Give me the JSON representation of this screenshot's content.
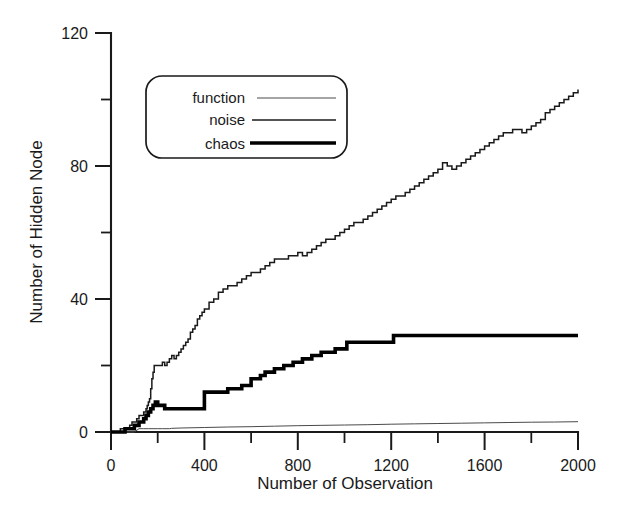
{
  "chart_data": {
    "type": "line",
    "title": "",
    "xlabel": "Number of Observation",
    "ylabel": "Number of Hidden Node",
    "xlim": [
      0,
      2000
    ],
    "ylim": [
      0,
      120
    ],
    "xticks": [
      0,
      400,
      800,
      1200,
      1600,
      2000
    ],
    "xtick_labels": [
      "0",
      "400",
      "800",
      "1200",
      "1600",
      "2000"
    ],
    "xminor_ticks": [
      200,
      600,
      1000,
      1400,
      1800
    ],
    "yticks": [
      0,
      40,
      80,
      120
    ],
    "ytick_labels": [
      "0",
      "40",
      "80",
      "120"
    ],
    "yminor_ticks": [
      20,
      60,
      100
    ],
    "grid": false,
    "legend_position": "upper-left-inset",
    "series": [
      {
        "name": "function",
        "line_weight": "thin",
        "color": "#4a4a4a",
        "x": [
          0,
          20,
          40,
          60,
          80,
          100,
          120,
          140,
          160,
          180,
          200,
          220,
          250,
          260,
          300,
          400,
          500,
          600,
          700,
          800,
          900,
          1000,
          1100,
          1200,
          1300,
          1400,
          1500,
          1600,
          1700,
          1800,
          1900,
          2000
        ],
        "values": [
          0,
          0,
          0,
          0,
          0,
          0,
          1,
          1,
          1,
          1,
          1,
          1,
          1,
          1.1,
          1.2,
          1.35,
          1.5,
          1.6,
          1.75,
          1.9,
          2.0,
          2.1,
          2.2,
          2.35,
          2.45,
          2.55,
          2.65,
          2.75,
          2.85,
          2.95,
          3.0,
          3.1
        ]
      },
      {
        "name": "noise",
        "line_weight": "medium",
        "color": "#1a1a1a",
        "x": [
          0,
          20,
          40,
          60,
          80,
          90,
          100,
          110,
          120,
          130,
          140,
          150,
          155,
          160,
          165,
          170,
          175,
          180,
          185,
          190,
          195,
          200,
          210,
          220,
          230,
          240,
          250,
          260,
          270,
          280,
          290,
          300,
          310,
          320,
          330,
          340,
          350,
          360,
          370,
          380,
          390,
          400,
          420,
          440,
          460,
          480,
          500,
          520,
          540,
          560,
          580,
          600,
          620,
          640,
          660,
          680,
          700,
          720,
          740,
          760,
          780,
          800,
          820,
          840,
          860,
          880,
          900,
          920,
          940,
          960,
          980,
          1000,
          1020,
          1040,
          1060,
          1080,
          1100,
          1120,
          1140,
          1160,
          1180,
          1200,
          1220,
          1240,
          1260,
          1280,
          1300,
          1320,
          1340,
          1360,
          1380,
          1400,
          1420,
          1440,
          1460,
          1480,
          1500,
          1520,
          1540,
          1560,
          1580,
          1600,
          1620,
          1640,
          1660,
          1680,
          1700,
          1720,
          1740,
          1760,
          1780,
          1800,
          1820,
          1840,
          1860,
          1880,
          1900,
          1920,
          1940,
          1960,
          1980,
          2000
        ],
        "values": [
          0,
          0,
          1,
          1,
          2,
          3,
          3,
          4,
          5,
          5,
          6,
          7,
          8,
          9,
          10,
          13,
          16,
          18,
          20,
          20,
          20,
          20,
          20,
          21,
          20,
          21,
          22,
          23,
          22,
          23,
          24,
          25,
          26,
          27,
          28,
          30,
          31,
          32,
          34,
          35,
          36,
          37,
          39,
          40,
          42,
          43,
          44,
          44,
          45,
          46,
          47,
          48,
          48,
          49,
          50,
          51,
          52,
          52,
          52,
          53,
          53,
          54,
          53,
          54,
          55,
          56,
          57,
          58,
          58,
          59,
          60,
          61,
          62,
          63,
          63,
          64,
          65,
          66,
          67,
          68,
          69,
          70,
          71,
          71,
          72,
          73,
          74,
          75,
          76,
          77,
          78,
          79,
          81,
          80,
          79,
          80,
          81,
          82,
          83,
          84,
          85,
          86,
          87,
          88,
          89,
          90,
          90,
          91,
          91,
          90,
          91,
          92,
          93,
          94,
          96,
          97,
          98,
          99,
          100,
          101,
          102,
          103
        ]
      },
      {
        "name": "chaos",
        "line_weight": "thick",
        "color": "#000000",
        "x": [
          0,
          40,
          60,
          80,
          100,
          120,
          140,
          150,
          160,
          170,
          180,
          190,
          200,
          210,
          230,
          250,
          260,
          390,
          400,
          420,
          440,
          490,
          500,
          540,
          560,
          590,
          600,
          620,
          640,
          660,
          680,
          700,
          720,
          740,
          760,
          780,
          800,
          820,
          840,
          860,
          880,
          900,
          940,
          960,
          1000,
          1010,
          1200,
          1210,
          2000
        ],
        "values": [
          0,
          0,
          1,
          1,
          2,
          3,
          4,
          5,
          6,
          7,
          8,
          9,
          8,
          8,
          7,
          7,
          7,
          7,
          12,
          12,
          12,
          12,
          13,
          13,
          14,
          14,
          16,
          16,
          17,
          18,
          18,
          19,
          19,
          20,
          20,
          21,
          21,
          22,
          22,
          23,
          23,
          24,
          24,
          25,
          25,
          27,
          27,
          29,
          29
        ]
      }
    ],
    "legend_entries": [
      "function",
      "noise",
      "chaos"
    ]
  },
  "axes": {
    "y_title": "Number of Hidden Node",
    "x_title": "Number of Observation"
  }
}
